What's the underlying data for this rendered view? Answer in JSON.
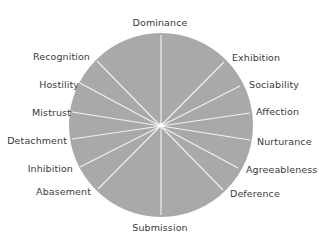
{
  "diagram": {
    "type": "circumplex",
    "colors": {
      "fill": "#a9a9a9",
      "spoke": "#f2f2f2",
      "text": "#3a3a3a",
      "background": "#ffffff"
    },
    "center": [
      161,
      125
    ],
    "radius": 92,
    "spokes": [
      [
        161,
        35,
        161,
        215
      ],
      [
        224,
        62,
        98,
        189
      ],
      [
        240,
        86,
        80,
        167
      ],
      [
        250,
        113,
        72,
        139
      ],
      [
        250,
        140,
        72,
        112
      ],
      [
        238,
        168,
        80,
        83
      ],
      [
        223,
        190,
        97,
        61
      ]
    ],
    "labels": {
      "dominance": "Dominance",
      "exhibition": "Exhibition",
      "sociability": "Sociability",
      "affection": "Affection",
      "nurturance": "Nurturance",
      "agreeableness": "Agreeableness",
      "deference": "Deference",
      "submission": "Submission",
      "abasement": "Abasement",
      "inhibition": "Inhibition",
      "detachment": "Detachment",
      "mistrust": "Mistrust",
      "hostility": "Hostility",
      "recognition": "Recognition"
    }
  }
}
